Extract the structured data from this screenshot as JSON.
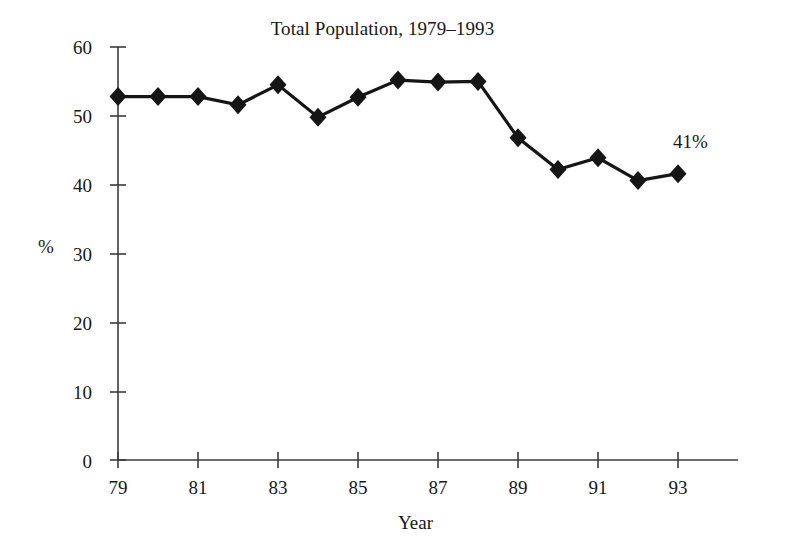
{
  "chart_data": {
    "type": "line",
    "title": "Total Population, 1979–1993",
    "xlabel": "Year",
    "ylabel": "%",
    "x": [
      1979,
      1980,
      1981,
      1982,
      1983,
      1984,
      1985,
      1986,
      1987,
      1988,
      1989,
      1990,
      1991,
      1992,
      1993
    ],
    "categories": [
      "79",
      "80",
      "81",
      "82",
      "83",
      "84",
      "85",
      "86",
      "87",
      "88",
      "89",
      "90",
      "91",
      "92",
      "93"
    ],
    "values": [
      52.8,
      52.8,
      52.8,
      51.6,
      54.5,
      49.8,
      52.7,
      55.2,
      54.9,
      55.0,
      46.8,
      42.2,
      43.9,
      40.6,
      41.6
    ],
    "series": [
      {
        "name": "Total Population",
        "values": [
          52.8,
          52.8,
          52.8,
          51.6,
          54.5,
          49.8,
          52.7,
          55.2,
          54.9,
          55.0,
          46.8,
          42.2,
          43.9,
          40.6,
          41.6
        ]
      }
    ],
    "xlim": [
      1979,
      1993
    ],
    "ylim": [
      0,
      60
    ],
    "ytick_labels": [
      "0",
      "10",
      "20",
      "30",
      "40",
      "50",
      "60"
    ],
    "ytick_values": [
      0,
      10,
      20,
      30,
      40,
      50,
      60
    ],
    "xtick_labels": [
      "79",
      "81",
      "83",
      "85",
      "87",
      "89",
      "91",
      "93"
    ],
    "xtick_values": [
      1979,
      1981,
      1983,
      1985,
      1987,
      1989,
      1991,
      1993
    ],
    "grid": false,
    "legend": false,
    "marker": "diamond",
    "line_color": "#151515",
    "marker_color": "#151515",
    "background": "#ffffff",
    "annotations": [
      {
        "text": "41%",
        "x": 1992.3,
        "y": 47.5
      }
    ]
  }
}
